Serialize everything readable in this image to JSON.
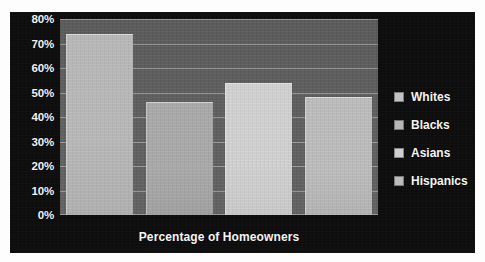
{
  "chart_data": {
    "type": "bar",
    "title": "",
    "xlabel": "Percentage of Homeowners",
    "ylabel": "",
    "categories": [
      "Whites",
      "Blacks",
      "Asians",
      "Hispanics"
    ],
    "values": [
      74,
      46,
      54,
      48
    ],
    "ylim": [
      0,
      80
    ],
    "y_ticks": [
      "0%",
      "10%",
      "20%",
      "30%",
      "40%",
      "50%",
      "60%",
      "70%",
      "80%"
    ],
    "y_tick_values": [
      0,
      10,
      20,
      30,
      40,
      50,
      60,
      70,
      80
    ],
    "grid": true,
    "legend_position": "right",
    "legend": [
      "Whites",
      "Blacks",
      "Asians",
      "Hispanics"
    ],
    "series": [
      {
        "name": "Percentage of Homeowners",
        "values": [
          74,
          46,
          54,
          48
        ]
      }
    ],
    "bar_colors": [
      "#b9b9b9",
      "#a9a9a9",
      "#d2d2d2",
      "#bdbdbd"
    ],
    "colors": {
      "background": "#0d0d0d",
      "plot_area": "#5e5e5e",
      "gridline": "#ebebeb",
      "text": "#f4f4f4"
    }
  },
  "axis": {
    "y_labels": [
      "80%",
      "70%",
      "60%",
      "50%",
      "40%",
      "30%",
      "20%",
      "10%",
      "0%"
    ],
    "x_title": "Percentage of Homeowners"
  },
  "legend": {
    "items": [
      {
        "label": "Whites",
        "swatch": "#c2c2c2"
      },
      {
        "label": "Blacks",
        "swatch": "#b6b6b6"
      },
      {
        "label": "Asians",
        "swatch": "#cfcfcf"
      },
      {
        "label": "Hispanics",
        "swatch": "#bcbcbc"
      }
    ]
  }
}
